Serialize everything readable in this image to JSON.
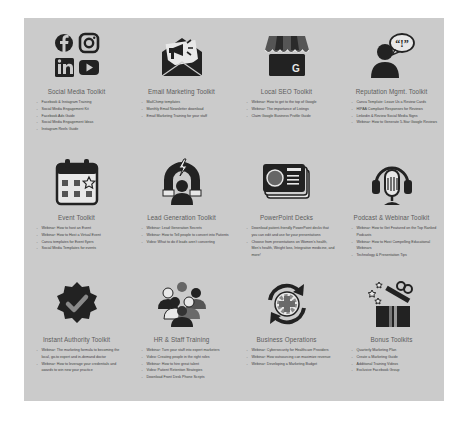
{
  "toolkits": [
    {
      "title": "Social Media Toolkit",
      "icon": "social-media-icons",
      "items": [
        "Facebook & Instagram Training",
        "Social Media Engagement Kit",
        "Facebook Ads Guide",
        "Social Media Engagement Ideas",
        "Instagram Reels Guide"
      ]
    },
    {
      "title": "Email Marketing Toolkit",
      "icon": "envelope-megaphone-icon",
      "items": [
        "MailChimp templates",
        "Monthly Email Newsletter download",
        "Email Marketing Training for your staff"
      ]
    },
    {
      "title": "Local SEO Toolkit",
      "icon": "google-storefront-icon",
      "items": [
        "Webinar: How to get to the top of Google",
        "Webinar: The importance of Listings",
        "Claim Google Business Profile Guide"
      ]
    },
    {
      "title": "Reputation Mgmt. Toolkit",
      "icon": "person-speech-bubble-icon",
      "items": [
        "Canva Template: Leave Us a Review Cards",
        "HIPAA Compliant Responses for Reviews",
        "Linkedin & Review Social Media Signs",
        "Webinar: How to Generate 5-Star Google Reviews"
      ]
    },
    {
      "title": "Event Toolkit",
      "icon": "calendar-star-icon",
      "items": [
        "Webinar: How to host an Event",
        "Webinar: How to Host a Virtual Event",
        "Canva templates for Event flyers",
        "Social Media Templates for events"
      ]
    },
    {
      "title": "Lead Generation Toolkit",
      "icon": "magnet-person-icon",
      "items": [
        "Webinar: Lead Generation Secrets",
        "Webinar: How to Tell people to convert into Patients",
        "Video: What to do if leads aren't converting"
      ]
    },
    {
      "title": "PowerPoint Decks",
      "icon": "presentation-cards-icon",
      "items": [
        "Download patient-friendly PowerPoint decks that you can edit and use for your presentations",
        "Choose from presentations on Women's health, Men's health, Weight loss, Integrative medicine, and more!"
      ]
    },
    {
      "title": "Podcast & Webinar Toolkit",
      "icon": "microphone-headphones-icon",
      "items": [
        "Webinar: How to Get Featured on the Top Ranked Podcasts",
        "Webinar: How to Host Compelling Educational Webinars",
        "Technology & Presentation Tips"
      ]
    },
    {
      "title": "Instant Authority Toolkit",
      "icon": "verified-badge-icon",
      "items": [
        "Webinar: The marketing formula to becoming the local, go-to expert and in-demand doctor",
        "Webinar: How to leverage your credentials and awards to win new your practice"
      ]
    },
    {
      "title": "HR & Staff Training",
      "icon": "team-group-icon",
      "items": [
        "Webinar: Turn your staff into expert marketers",
        "Video: Creating people in the right roles",
        "Webinar: How to hire great talent",
        "Video: Patient Retention Strategies",
        "Download Front Desk Phone Scripts"
      ]
    },
    {
      "title": "Business Operations",
      "icon": "cycle-operations-icon",
      "items": [
        "Webinar: Cybersecurity for Healthcare Providers",
        "Webinar: How outsourcing can maximize revenue",
        "Webinar: Developing a Marketing Budget"
      ]
    },
    {
      "title": "Bonus Toolkits",
      "icon": "gift-box-icon",
      "items": [
        "Quarterly Marketing Plan",
        "Create a Marketing Guide",
        "Additional Training Videos",
        "Exclusive Facebook Group"
      ]
    }
  ],
  "colors": {
    "panel_bg": "#cbcbcb",
    "icon_dark": "#222222",
    "icon_mid": "#6a6a6a",
    "title_text": "#5c5c5c",
    "body_text": "#3e3e3e"
  }
}
